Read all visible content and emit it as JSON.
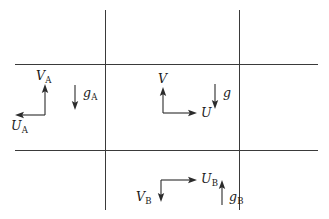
{
  "figure": {
    "background_color": "#ffffff",
    "line_color": "#3a3a3a",
    "vector_color": "#2b2b2b",
    "width": 329,
    "height": 219
  },
  "grid": {
    "horizontal_lines": [
      {
        "name": "upper-horizontal-grid-line",
        "y": 64,
        "x1": 15,
        "x2": 318
      },
      {
        "name": "lower-horizontal-grid-line",
        "y": 150,
        "x1": 15,
        "x2": 318
      }
    ],
    "vertical_lines": [
      {
        "name": "left-vertical-grid-line",
        "x": 105,
        "y1": 10,
        "y2": 210
      },
      {
        "name": "right-vertical-grid-line",
        "x": 239,
        "y1": 10,
        "y2": 210
      }
    ]
  },
  "vectors": {
    "cell_a": {
      "v_label": "V",
      "v_subscript": "A",
      "v_direction": "up",
      "u_label": "U",
      "u_subscript": "A",
      "u_direction": "left",
      "g_label": "g",
      "g_subscript": "A",
      "g_direction": "down"
    },
    "cell_center": {
      "v_label": "V",
      "v_subscript": "",
      "v_direction": "up",
      "u_label": "U",
      "u_subscript": "",
      "u_direction": "right",
      "g_label": "g",
      "g_subscript": "",
      "g_direction": "down"
    },
    "cell_b": {
      "v_label": "V",
      "v_subscript": "B",
      "v_direction": "down",
      "u_label": "U",
      "u_subscript": "B",
      "u_direction": "right",
      "g_label": "g",
      "g_subscript": "B",
      "g_direction": "up"
    }
  }
}
